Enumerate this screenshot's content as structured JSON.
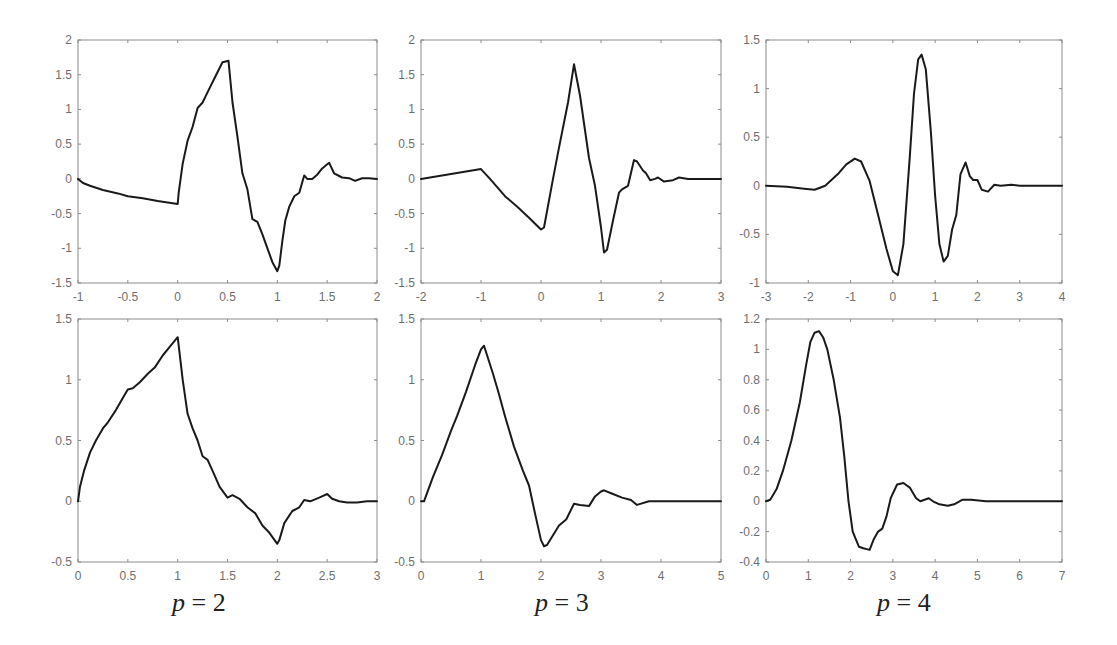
{
  "figure": {
    "captions": [
      {
        "var": "p",
        "eq": "=",
        "val": "2",
        "x": 172
      },
      {
        "var": "p",
        "eq": "=",
        "val": "3",
        "x": 535
      },
      {
        "var": "p",
        "eq": "=",
        "val": "4",
        "x": 877
      }
    ],
    "style": {
      "line_color": "#1a1a1a",
      "axis_color": "#8c8c8c",
      "tick_label_color": "#6e6e6e",
      "background": "#ffffff"
    }
  },
  "chart_data": [
    {
      "type": "line",
      "title": "",
      "panel": "top-left",
      "column": "p = 2",
      "xlabel": "",
      "ylabel": "",
      "xlim": [
        -1,
        2
      ],
      "ylim": [
        -1.5,
        2
      ],
      "xticks": [
        -1,
        -0.5,
        0,
        0.5,
        1,
        1.5,
        2
      ],
      "yticks": [
        -1.5,
        -1,
        -0.5,
        0,
        0.5,
        1,
        1.5,
        2
      ],
      "xtick_labels": [
        "-1",
        "-0.5",
        "0",
        "0.5",
        "1",
        "1.5",
        "2"
      ],
      "ytick_labels": [
        "-1.5",
        "-1",
        "-0.5",
        "0",
        "0.5",
        "1",
        "1.5",
        "2"
      ],
      "grid": false,
      "box": [
        78,
        40,
        377,
        283
      ],
      "x": [
        -1,
        -0.95,
        -0.88,
        -0.75,
        -0.6,
        -0.5,
        -0.35,
        -0.2,
        -0.1,
        0,
        0.01,
        0.05,
        0.1,
        0.15,
        0.2,
        0.25,
        0.3,
        0.37,
        0.45,
        0.51,
        0.55,
        0.6,
        0.65,
        0.7,
        0.75,
        0.8,
        0.85,
        0.9,
        0.95,
        1.0,
        1.02,
        1.05,
        1.08,
        1.12,
        1.17,
        1.22,
        1.27,
        1.3,
        1.35,
        1.4,
        1.45,
        1.5,
        1.52,
        1.57,
        1.65,
        1.72,
        1.78,
        1.85,
        1.92,
        2.0
      ],
      "y": [
        0,
        -0.06,
        -0.1,
        -0.16,
        -0.21,
        -0.25,
        -0.28,
        -0.32,
        -0.34,
        -0.36,
        -0.2,
        0.22,
        0.55,
        0.75,
        1.02,
        1.1,
        1.25,
        1.45,
        1.68,
        1.7,
        1.1,
        0.6,
        0.08,
        -0.15,
        -0.58,
        -0.62,
        -0.8,
        -1.0,
        -1.2,
        -1.33,
        -1.25,
        -0.9,
        -0.6,
        -0.4,
        -0.25,
        -0.2,
        0.05,
        0.0,
        0.0,
        0.06,
        0.15,
        0.21,
        0.23,
        0.08,
        0.02,
        0.01,
        -0.03,
        0.01,
        0.01,
        0.0
      ]
    },
    {
      "type": "line",
      "panel": "top-middle",
      "column": "p = 3",
      "title": "",
      "xlabel": "",
      "ylabel": "",
      "xlim": [
        -2,
        3
      ],
      "ylim": [
        -1.5,
        2
      ],
      "xticks": [
        -2,
        -1,
        0,
        1,
        2,
        3
      ],
      "yticks": [
        -1.5,
        -1,
        -0.5,
        0,
        0.5,
        1,
        1.5,
        2
      ],
      "xtick_labels": [
        "-2",
        "-1",
        "0",
        "1",
        "2",
        "3"
      ],
      "ytick_labels": [
        "-1.5",
        "-1",
        "-0.5",
        "0",
        "0.5",
        "1",
        "1.5",
        "2"
      ],
      "grid": false,
      "box": [
        421,
        40,
        721,
        283
      ],
      "x": [
        -2,
        -1.5,
        -1,
        -0.85,
        -0.6,
        -0.4,
        -0.2,
        0,
        0.05,
        0.2,
        0.3,
        0.45,
        0.55,
        0.65,
        0.8,
        0.9,
        1.0,
        1.05,
        1.1,
        1.2,
        1.3,
        1.35,
        1.45,
        1.55,
        1.6,
        1.7,
        1.75,
        1.82,
        1.9,
        1.95,
        2.05,
        2.2,
        2.3,
        2.45,
        3.0
      ],
      "y": [
        0,
        0.07,
        0.14,
        0.0,
        -0.25,
        -0.4,
        -0.56,
        -0.73,
        -0.7,
        0.0,
        0.45,
        1.1,
        1.65,
        1.2,
        0.3,
        -0.1,
        -0.7,
        -1.06,
        -1.02,
        -0.6,
        -0.2,
        -0.15,
        -0.1,
        0.27,
        0.25,
        0.12,
        0.08,
        -0.02,
        0.0,
        0.02,
        -0.04,
        -0.02,
        0.02,
        0.0,
        0.0
      ]
    },
    {
      "type": "line",
      "panel": "top-right",
      "column": "p = 4",
      "title": "",
      "xlabel": "",
      "ylabel": "",
      "xlim": [
        -3,
        4
      ],
      "ylim": [
        -1,
        1.5
      ],
      "xticks": [
        -3,
        -2,
        -1,
        0,
        1,
        2,
        3,
        4
      ],
      "yticks": [
        -1,
        -0.5,
        0,
        0.5,
        1,
        1.5
      ],
      "xtick_labels": [
        "-3",
        "-2",
        "-1",
        "0",
        "1",
        "2",
        "3",
        "4"
      ],
      "ytick_labels": [
        "-1",
        "-0.5",
        "0",
        "0.5",
        "1",
        "1.5"
      ],
      "grid": false,
      "box": [
        766,
        40,
        1062,
        283
      ],
      "x": [
        -3,
        -2.5,
        -2.1,
        -1.85,
        -1.6,
        -1.3,
        -1.1,
        -0.9,
        -0.75,
        -0.55,
        -0.35,
        -0.15,
        0.0,
        0.12,
        0.25,
        0.4,
        0.5,
        0.6,
        0.68,
        0.78,
        0.9,
        1.0,
        1.1,
        1.2,
        1.3,
        1.4,
        1.5,
        1.6,
        1.72,
        1.82,
        1.9,
        2.0,
        2.1,
        2.25,
        2.4,
        2.55,
        2.8,
        3.0,
        4.0
      ],
      "y": [
        0,
        -0.01,
        -0.03,
        -0.04,
        0.0,
        0.12,
        0.22,
        0.28,
        0.25,
        0.05,
        -0.3,
        -0.65,
        -0.88,
        -0.92,
        -0.6,
        0.3,
        0.95,
        1.3,
        1.35,
        1.2,
        0.55,
        -0.1,
        -0.6,
        -0.78,
        -0.72,
        -0.45,
        -0.3,
        0.12,
        0.24,
        0.1,
        0.06,
        0.06,
        -0.04,
        -0.06,
        0.01,
        0.0,
        0.01,
        0.0,
        0.0
      ]
    },
    {
      "type": "line",
      "panel": "bottom-left",
      "column": "p = 2",
      "title": "",
      "xlabel": "",
      "ylabel": "",
      "xlim": [
        0,
        3
      ],
      "ylim": [
        -0.5,
        1.5
      ],
      "xticks": [
        0,
        0.5,
        1,
        1.5,
        2,
        2.5,
        3
      ],
      "yticks": [
        -0.5,
        0,
        0.5,
        1,
        1.5
      ],
      "xtick_labels": [
        "0",
        "0.5",
        "1",
        "1.5",
        "2",
        "2.5",
        "3"
      ],
      "ytick_labels": [
        "-0.5",
        "0",
        "0.5",
        "1",
        "1.5"
      ],
      "grid": false,
      "box": [
        78,
        319,
        377,
        562
      ],
      "x": [
        0,
        0.02,
        0.06,
        0.12,
        0.18,
        0.25,
        0.3,
        0.38,
        0.45,
        0.5,
        0.55,
        0.62,
        0.7,
        0.77,
        0.85,
        0.92,
        1.0,
        1.05,
        1.1,
        1.15,
        1.2,
        1.25,
        1.3,
        1.35,
        1.42,
        1.5,
        1.55,
        1.62,
        1.7,
        1.78,
        1.85,
        1.92,
        2.0,
        2.02,
        2.07,
        2.15,
        2.22,
        2.27,
        2.33,
        2.42,
        2.5,
        2.55,
        2.62,
        2.7,
        2.8,
        2.9,
        3.0
      ],
      "y": [
        0,
        0.12,
        0.25,
        0.4,
        0.5,
        0.6,
        0.65,
        0.75,
        0.85,
        0.92,
        0.93,
        0.98,
        1.05,
        1.1,
        1.2,
        1.27,
        1.35,
        1.0,
        0.72,
        0.6,
        0.5,
        0.37,
        0.34,
        0.25,
        0.12,
        0.03,
        0.05,
        0.02,
        -0.05,
        -0.1,
        -0.2,
        -0.26,
        -0.35,
        -0.32,
        -0.18,
        -0.08,
        -0.05,
        0.01,
        0.0,
        0.03,
        0.06,
        0.02,
        0.0,
        -0.01,
        -0.01,
        0.0,
        0.0
      ]
    },
    {
      "type": "line",
      "panel": "bottom-middle",
      "column": "p = 3",
      "title": "",
      "xlabel": "",
      "ylabel": "",
      "xlim": [
        0,
        5
      ],
      "ylim": [
        -0.5,
        1.5
      ],
      "xticks": [
        0,
        1,
        2,
        3,
        4,
        5
      ],
      "yticks": [
        -0.5,
        0,
        0.5,
        1,
        1.5
      ],
      "xtick_labels": [
        "0",
        "1",
        "2",
        "3",
        "4",
        "5"
      ],
      "ytick_labels": [
        "-0.5",
        "0",
        "0.5",
        "1",
        "1.5"
      ],
      "grid": false,
      "box": [
        421,
        319,
        721,
        562
      ],
      "x": [
        0,
        0.05,
        0.2,
        0.35,
        0.5,
        0.6,
        0.75,
        0.9,
        1.0,
        1.05,
        1.2,
        1.3,
        1.4,
        1.55,
        1.7,
        1.8,
        1.9,
        2.0,
        2.05,
        2.1,
        2.2,
        2.3,
        2.42,
        2.55,
        2.65,
        2.8,
        2.9,
        3.0,
        3.05,
        3.2,
        3.35,
        3.5,
        3.6,
        3.8,
        4.0,
        5.0
      ],
      "y": [
        0,
        0.0,
        0.2,
        0.38,
        0.58,
        0.7,
        0.9,
        1.12,
        1.25,
        1.28,
        1.05,
        0.88,
        0.7,
        0.45,
        0.25,
        0.13,
        -0.1,
        -0.32,
        -0.37,
        -0.36,
        -0.28,
        -0.2,
        -0.15,
        -0.02,
        -0.03,
        -0.04,
        0.04,
        0.08,
        0.09,
        0.06,
        0.03,
        0.01,
        -0.03,
        0.0,
        0.0,
        0.0
      ]
    },
    {
      "type": "line",
      "panel": "bottom-right",
      "column": "p = 4",
      "title": "",
      "xlabel": "",
      "ylabel": "",
      "xlim": [
        0,
        7
      ],
      "ylim": [
        -0.4,
        1.2
      ],
      "xticks": [
        0,
        1,
        2,
        3,
        4,
        5,
        6,
        7
      ],
      "yticks": [
        -0.4,
        -0.2,
        0,
        0.2,
        0.4,
        0.6,
        0.8,
        1,
        1.2
      ],
      "xtick_labels": [
        "0",
        "1",
        "2",
        "3",
        "4",
        "5",
        "6",
        "7"
      ],
      "ytick_labels": [
        "-0.4",
        "-0.2",
        "0",
        "0.2",
        "0.4",
        "0.6",
        "0.8",
        "1",
        "1.2"
      ],
      "grid": false,
      "box": [
        766,
        319,
        1062,
        562
      ],
      "x": [
        0,
        0.1,
        0.25,
        0.4,
        0.6,
        0.8,
        0.95,
        1.05,
        1.15,
        1.25,
        1.35,
        1.45,
        1.6,
        1.75,
        1.85,
        1.95,
        2.05,
        2.2,
        2.3,
        2.45,
        2.55,
        2.65,
        2.75,
        2.85,
        2.95,
        3.1,
        3.25,
        3.4,
        3.55,
        3.65,
        3.75,
        3.85,
        3.95,
        4.1,
        4.3,
        4.45,
        4.65,
        4.85,
        5.2,
        7.0
      ],
      "y": [
        0,
        0.01,
        0.08,
        0.2,
        0.4,
        0.65,
        0.9,
        1.05,
        1.11,
        1.12,
        1.08,
        1.0,
        0.8,
        0.55,
        0.3,
        0.0,
        -0.2,
        -0.3,
        -0.31,
        -0.32,
        -0.25,
        -0.2,
        -0.18,
        -0.1,
        0.02,
        0.11,
        0.12,
        0.09,
        0.02,
        0.0,
        0.01,
        0.02,
        0.0,
        -0.02,
        -0.03,
        -0.02,
        0.01,
        0.01,
        0.0,
        0.0
      ]
    }
  ]
}
